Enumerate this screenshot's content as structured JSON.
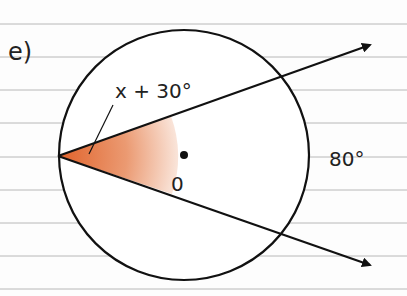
{
  "problem": {
    "label": "e)"
  },
  "diagram": {
    "angle_at_circumference_label": "x + 30°",
    "center_label": "0",
    "arc_label": "80°"
  },
  "colors": {
    "ink": "#111111",
    "ruled_line": "#b8b8b8",
    "sector_fill_start": "#e0622a",
    "sector_fill_end": "#ffffff",
    "background": "#fdfdfd"
  }
}
